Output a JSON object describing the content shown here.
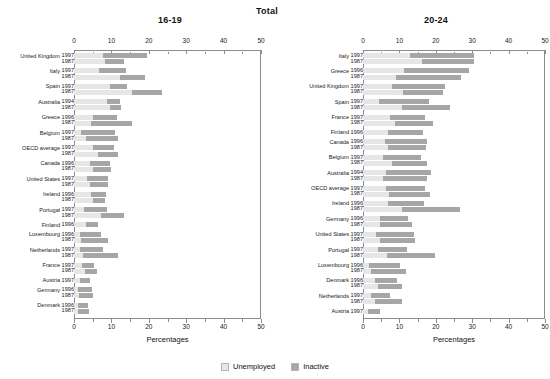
{
  "titles": {
    "left": "16-19",
    "center": "Total",
    "right": "20-24"
  },
  "axis": {
    "caption": "Percentages",
    "ticks": [
      "0",
      "10",
      "20",
      "30",
      "40",
      "50"
    ],
    "min": 0,
    "max": 50
  },
  "legend": {
    "unemployed": "Unemployed",
    "inactive": "Inactive"
  },
  "colors": {
    "unemployed": "#e6e6e6",
    "inactive": "#a6a6a6",
    "frame": "#8c8c8c",
    "text": "#1a1a1a"
  },
  "chart_data": {
    "type": "bar",
    "orientation": "horizontal",
    "stacked": true,
    "title": "Total",
    "xlabel": "Percentages",
    "ylabel": "",
    "xlim": [
      0,
      50
    ],
    "grid": false,
    "legend_position": "bottom-center",
    "series": [
      {
        "name": "Unemployed",
        "color": "#e6e6e6"
      },
      {
        "name": "Inactive",
        "color": "#a6a6a6"
      }
    ],
    "panels": [
      {
        "name": "16-19",
        "categories": [
          {
            "country": "United Kingdom",
            "years": [
              "1997",
              "1987"
            ],
            "rows": [
              {
                "year": "1997",
                "unemployed": 7.8,
                "inactive": 11.7,
                "total": 19.5
              },
              {
                "year": "1987",
                "unemployed": 8.4,
                "inactive": 5.1,
                "total": 13.5
              }
            ]
          },
          {
            "country": "Italy",
            "years": [
              "1997",
              "1987"
            ],
            "rows": [
              {
                "year": "1997",
                "unemployed": 6.6,
                "inactive": 7.3,
                "total": 13.9
              },
              {
                "year": "1987",
                "unemployed": 12.2,
                "inactive": 6.9,
                "total": 19.1
              }
            ]
          },
          {
            "country": "Spain",
            "years": [
              "1997",
              "1987"
            ],
            "rows": [
              {
                "year": "1997",
                "unemployed": 9.7,
                "inactive": 4.5,
                "total": 14.2
              },
              {
                "year": "1987",
                "unemployed": 15.6,
                "inactive": 7.8,
                "total": 23.4
              }
            ]
          },
          {
            "country": "Australia",
            "years": [
              "1994",
              "1987"
            ],
            "rows": [
              {
                "year": "1994",
                "unemployed": 8.9,
                "inactive": 3.4,
                "total": 12.3
              },
              {
                "year": "1987",
                "unemployed": 9.6,
                "inactive": 3.1,
                "total": 12.7
              }
            ]
          },
          {
            "country": "Greece",
            "years": [
              "1996",
              "1987"
            ],
            "rows": [
              {
                "year": "1996",
                "unemployed": 5.1,
                "inactive": 6.4,
                "total": 11.5
              },
              {
                "year": "1987",
                "unemployed": 4.5,
                "inactive": 10.9,
                "total": 15.4
              }
            ]
          },
          {
            "country": "Belgium",
            "years": [
              "1997",
              "1987"
            ],
            "rows": [
              {
                "year": "1997",
                "unemployed": 2.0,
                "inactive": 8.9,
                "total": 10.9
              },
              {
                "year": "1987",
                "unemployed": 3.1,
                "inactive": 8.6,
                "total": 11.7
              }
            ]
          },
          {
            "country": "OECD average",
            "years": [
              "1997",
              "1987"
            ],
            "rows": [
              {
                "year": "1997",
                "unemployed": 5.0,
                "inactive": 5.6,
                "total": 10.6
              },
              {
                "year": "1987",
                "unemployed": 6.3,
                "inactive": 5.6,
                "total": 11.9
              }
            ]
          },
          {
            "country": "Canada",
            "years": [
              "1996",
              "1987"
            ],
            "rows": [
              {
                "year": "1996",
                "unemployed": 4.3,
                "inactive": 5.3,
                "total": 9.6
              },
              {
                "year": "1987",
                "unemployed": 5.2,
                "inactive": 4.6,
                "total": 9.8
              }
            ]
          },
          {
            "country": "United States",
            "years": [
              "1997",
              "1987"
            ],
            "rows": [
              {
                "year": "1997",
                "unemployed": 3.6,
                "inactive": 5.6,
                "total": 9.2
              },
              {
                "year": "1987",
                "unemployed": 4.4,
                "inactive": 4.8,
                "total": 9.2
              }
            ]
          },
          {
            "country": "Ireland",
            "years": [
              "1996",
              "1987"
            ],
            "rows": [
              {
                "year": "1996",
                "unemployed": 4.6,
                "inactive": 4.0,
                "total": 8.6
              },
              {
                "year": "1987",
                "unemployed": 5.0,
                "inactive": 3.2,
                "total": 8.2
              }
            ]
          },
          {
            "country": "Portugal",
            "years": [
              "1997",
              "1987"
            ],
            "rows": [
              {
                "year": "1997",
                "unemployed": 2.7,
                "inactive": 6.1,
                "total": 8.8
              },
              {
                "year": "1987",
                "unemployed": 7.3,
                "inactive": 6.0,
                "total": 13.3
              }
            ]
          },
          {
            "country": "Finland",
            "years": [
              "1996"
            ],
            "rows": [
              {
                "year": "1996",
                "unemployed": 3.1,
                "inactive": 3.2,
                "total": 6.3
              }
            ]
          },
          {
            "country": "Luxembourg",
            "years": [
              "1996",
              "1987"
            ],
            "rows": [
              {
                "year": "1996",
                "unemployed": 1.6,
                "inactive": 5.5,
                "total": 7.1
              },
              {
                "year": "1987",
                "unemployed": 1.9,
                "inactive": 7.2,
                "total": 9.1
              }
            ]
          },
          {
            "country": "Netherlands",
            "years": [
              "1997",
              "1987"
            ],
            "rows": [
              {
                "year": "1997",
                "unemployed": 1.5,
                "inactive": 6.2,
                "total": 7.7
              },
              {
                "year": "1987",
                "unemployed": 2.3,
                "inactive": 9.4,
                "total": 11.7
              }
            ]
          },
          {
            "country": "France",
            "years": [
              "1997",
              "1987"
            ],
            "rows": [
              {
                "year": "1997",
                "unemployed": 2.2,
                "inactive": 3.2,
                "total": 5.4
              },
              {
                "year": "1987",
                "unemployed": 3.0,
                "inactive": 3.1,
                "total": 6.1
              }
            ]
          },
          {
            "country": "Austria",
            "years": [
              "1997"
            ],
            "rows": [
              {
                "year": "1997",
                "unemployed": 1.7,
                "inactive": 2.6,
                "total": 4.3
              }
            ]
          },
          {
            "country": "Germany",
            "years": [
              "1996",
              "1987"
            ],
            "rows": [
              {
                "year": "1996",
                "unemployed": 1.2,
                "inactive": 3.7,
                "total": 4.9
              },
              {
                "year": "1987",
                "unemployed": 1.4,
                "inactive": 3.6,
                "total": 5.0
              }
            ]
          },
          {
            "country": "Denmark",
            "years": [
              "1996",
              "1987"
            ],
            "rows": [
              {
                "year": "1996",
                "unemployed": 1.1,
                "inactive": 2.7,
                "total": 3.8
              },
              {
                "year": "1987",
                "unemployed": 1.2,
                "inactive": 2.9,
                "total": 4.1
              }
            ]
          }
        ]
      },
      {
        "name": "20-24",
        "categories": [
          {
            "country": "Italy",
            "years": [
              "1997",
              "1987"
            ],
            "rows": [
              {
                "year": "1997",
                "unemployed": 12.8,
                "inactive": 17.6,
                "total": 30.4
              },
              {
                "year": "1987",
                "unemployed": 16.1,
                "inactive": 14.3,
                "total": 30.4
              }
            ]
          },
          {
            "country": "Greece",
            "years": [
              "1996",
              "1987"
            ],
            "rows": [
              {
                "year": "1996",
                "unemployed": 11.3,
                "inactive": 17.9,
                "total": 29.2
              },
              {
                "year": "1987",
                "unemployed": 9.2,
                "inactive": 17.6,
                "total": 26.8
              }
            ]
          },
          {
            "country": "United Kingdom",
            "years": [
              "1997",
              "1987"
            ],
            "rows": [
              {
                "year": "1997",
                "unemployed": 8.1,
                "inactive": 14.4,
                "total": 22.5
              },
              {
                "year": "1987",
                "unemployed": 11.0,
                "inactive": 11.0,
                "total": 22.0
              }
            ]
          },
          {
            "country": "Spain",
            "years": [
              "1997",
              "1987"
            ],
            "rows": [
              {
                "year": "1997",
                "unemployed": 4.3,
                "inactive": 13.8,
                "total": 18.1
              },
              {
                "year": "1987",
                "unemployed": 10.8,
                "inactive": 13.0,
                "total": 23.8
              }
            ]
          },
          {
            "country": "France",
            "years": [
              "1997",
              "1987"
            ],
            "rows": [
              {
                "year": "1997",
                "unemployed": 7.5,
                "inactive": 9.6,
                "total": 17.1
              },
              {
                "year": "1987",
                "unemployed": 8.9,
                "inactive": 10.2,
                "total": 19.1
              }
            ]
          },
          {
            "country": "Finland",
            "years": [
              "1996"
            ],
            "rows": [
              {
                "year": "1996",
                "unemployed": 6.9,
                "inactive": 9.5,
                "total": 16.4
              }
            ]
          },
          {
            "country": "Canada",
            "years": [
              "1996",
              "1987"
            ],
            "rows": [
              {
                "year": "1996",
                "unemployed": 6.1,
                "inactive": 11.5,
                "total": 17.6
              },
              {
                "year": "1987",
                "unemployed": 6.8,
                "inactive": 10.6,
                "total": 17.4
              }
            ]
          },
          {
            "country": "Belgium",
            "years": [
              "1997",
              "1987"
            ],
            "rows": [
              {
                "year": "1997",
                "unemployed": 5.4,
                "inactive": 10.6,
                "total": 16.0
              },
              {
                "year": "1987",
                "unemployed": 7.9,
                "inactive": 9.7,
                "total": 17.6
              }
            ]
          },
          {
            "country": "Australia",
            "years": [
              "1994",
              "1987"
            ],
            "rows": [
              {
                "year": "1994",
                "unemployed": 6.4,
                "inactive": 12.4,
                "total": 18.8
              },
              {
                "year": "1987",
                "unemployed": 5.6,
                "inactive": 12.0,
                "total": 17.6
              }
            ]
          },
          {
            "country": "OECD average",
            "years": [
              "1997",
              "1987"
            ],
            "rows": [
              {
                "year": "1997",
                "unemployed": 6.3,
                "inactive": 10.8,
                "total": 17.1
              },
              {
                "year": "1987",
                "unemployed": 7.2,
                "inactive": 11.2,
                "total": 18.4
              }
            ]
          },
          {
            "country": "Ireland",
            "years": [
              "1996",
              "1987"
            ],
            "rows": [
              {
                "year": "1996",
                "unemployed": 6.9,
                "inactive": 9.9,
                "total": 16.8
              },
              {
                "year": "1987",
                "unemployed": 10.8,
                "inactive": 15.8,
                "total": 26.6
              }
            ]
          },
          {
            "country": "Germany",
            "years": [
              "1996",
              "1987"
            ],
            "rows": [
              {
                "year": "1996",
                "unemployed": 4.7,
                "inactive": 7.8,
                "total": 12.5
              },
              {
                "year": "1987",
                "unemployed": 4.6,
                "inactive": 9.0,
                "total": 13.6
              }
            ]
          },
          {
            "country": "United States",
            "years": [
              "1997",
              "1987"
            ],
            "rows": [
              {
                "year": "1997",
                "unemployed": 3.7,
                "inactive": 10.4,
                "total": 14.1
              },
              {
                "year": "1987",
                "unemployed": 4.7,
                "inactive": 9.7,
                "total": 14.4
              }
            ]
          },
          {
            "country": "Portugal",
            "years": [
              "1997",
              "1987"
            ],
            "rows": [
              {
                "year": "1997",
                "unemployed": 4.0,
                "inactive": 8.1,
                "total": 12.1
              },
              {
                "year": "1987",
                "unemployed": 6.5,
                "inactive": 13.2,
                "total": 19.7
              }
            ]
          },
          {
            "country": "Luxembourg",
            "years": [
              "1996",
              "1987"
            ],
            "rows": [
              {
                "year": "1996",
                "unemployed": 1.6,
                "inactive": 8.5,
                "total": 10.1
              },
              {
                "year": "1987",
                "unemployed": 2.1,
                "inactive": 9.6,
                "total": 11.7
              }
            ]
          },
          {
            "country": "Denmark",
            "years": [
              "1996",
              "1987"
            ],
            "rows": [
              {
                "year": "1996",
                "unemployed": 3.4,
                "inactive": 6.0,
                "total": 9.4
              },
              {
                "year": "1987",
                "unemployed": 4.1,
                "inactive": 6.5,
                "total": 10.6
              }
            ]
          },
          {
            "country": "Netherlands",
            "years": [
              "1997",
              "1987"
            ],
            "rows": [
              {
                "year": "1997",
                "unemployed": 2.3,
                "inactive": 5.0,
                "total": 7.3
              },
              {
                "year": "1987",
                "unemployed": 3.2,
                "inactive": 7.5,
                "total": 10.7
              }
            ]
          },
          {
            "country": "Austria",
            "years": [
              "1997"
            ],
            "rows": [
              {
                "year": "1997",
                "unemployed": 1.3,
                "inactive": 3.4,
                "total": 4.7
              }
            ]
          }
        ]
      }
    ]
  }
}
